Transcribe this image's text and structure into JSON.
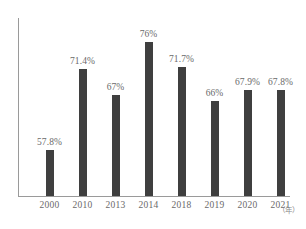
{
  "chart_data": {
    "type": "bar",
    "title": "",
    "subtitle": "",
    "xlabel": "(年)",
    "ylabel": "",
    "grid": false,
    "legend": false,
    "axis_color": "#9a9a9a",
    "bar_color": "#3f3f3f",
    "label_color": "#6a6a6a",
    "ylim": [
      50,
      80
    ],
    "categories": [
      "2000",
      "2010",
      "2013",
      "2014",
      "2018",
      "2019",
      "2020",
      "2021"
    ],
    "values": [
      57.8,
      71.4,
      67,
      76,
      71.7,
      66,
      67.9,
      67.8
    ],
    "value_labels": [
      "57.8%",
      "71.4%",
      "67%",
      "76%",
      "71.7%",
      "66%",
      "67.9%",
      "67.8%"
    ],
    "points": [
      {
        "category": "2000",
        "value": 57.8,
        "label": "57.8%"
      },
      {
        "category": "2010",
        "value": 71.4,
        "label": "71.4%"
      },
      {
        "category": "2013",
        "value": 67,
        "label": "67%"
      },
      {
        "category": "2014",
        "value": 76,
        "label": "76%"
      },
      {
        "category": "2018",
        "value": 71.7,
        "label": "71.7%"
      },
      {
        "category": "2019",
        "value": 66,
        "label": "66%"
      },
      {
        "category": "2020",
        "value": 67.9,
        "label": "67.9%"
      },
      {
        "category": "2021",
        "value": 67.8,
        "label": "67.8%"
      }
    ]
  },
  "axis": {
    "unit_label": "（年）"
  }
}
